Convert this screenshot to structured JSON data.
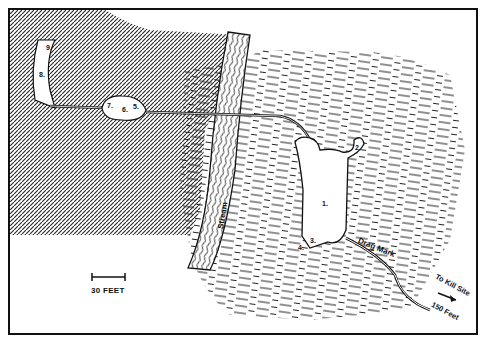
{
  "map": {
    "type": "site sketch map",
    "scale_bar": {
      "label": "30 FEET"
    },
    "features": {
      "stream_label": "Stream",
      "drag_mark_label": "Drag Mark",
      "kill_site_line1": "To Kill Site",
      "kill_site_line2": "150 Feet"
    },
    "numbered_points": [
      "1.",
      "2.",
      "3.",
      "4.",
      "5.",
      "6.",
      "7.",
      "8.",
      "9."
    ],
    "colors": {
      "ink": "#111111",
      "paper": "#ffffff"
    }
  }
}
